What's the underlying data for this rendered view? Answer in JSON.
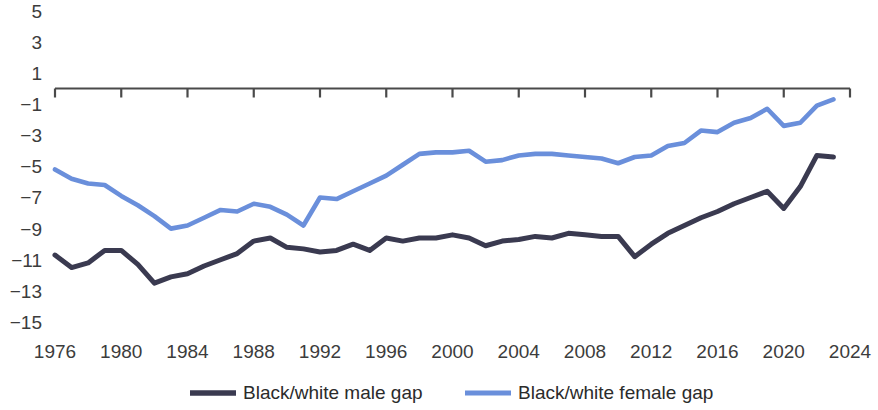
{
  "chart_data": {
    "type": "line",
    "title": "",
    "subtitle": "",
    "xlabel": "",
    "ylabel": "",
    "grid": false,
    "legend_position": "bottom",
    "xlim": [
      1976,
      2024
    ],
    "ylim": [
      -15,
      5
    ],
    "x_ticks": [
      "1976",
      "1980",
      "1984",
      "1988",
      "1992",
      "1996",
      "2000",
      "2004",
      "2008",
      "2012",
      "2016",
      "2020",
      "2024"
    ],
    "y_ticks": [
      "5",
      "3",
      "1",
      "−1",
      "−3",
      "−5",
      "−7",
      "−9",
      "−11",
      "−13",
      "−15"
    ],
    "x": [
      1976,
      1977,
      1978,
      1979,
      1980,
      1981,
      1982,
      1983,
      1984,
      1985,
      1986,
      1987,
      1988,
      1989,
      1990,
      1991,
      1992,
      1993,
      1994,
      1995,
      1996,
      1997,
      1998,
      1999,
      2000,
      2001,
      2002,
      2003,
      2004,
      2005,
      2006,
      2007,
      2008,
      2009,
      2010,
      2011,
      2012,
      2013,
      2014,
      2015,
      2016,
      2017,
      2018,
      2019,
      2020,
      2021,
      2022,
      2023
    ],
    "series": [
      {
        "name": "Black/white male gap",
        "color": "#3a3a50",
        "values": [
          -10.7,
          -11.5,
          -11.2,
          -10.4,
          -10.4,
          -11.3,
          -12.5,
          -12.1,
          -11.9,
          -11.4,
          -11.0,
          -10.6,
          -9.8,
          -9.6,
          -10.2,
          -10.3,
          -10.5,
          -10.4,
          -10.0,
          -10.4,
          -9.6,
          -9.8,
          -9.6,
          -9.6,
          -9.4,
          -9.6,
          -10.1,
          -9.8,
          -9.7,
          -9.5,
          -9.6,
          -9.3,
          -9.4,
          -9.5,
          -9.5,
          -10.8,
          -10.0,
          -9.3,
          -8.8,
          -8.3,
          -7.9,
          -7.4,
          -7.0,
          -6.6,
          -7.7,
          -6.3,
          -4.3,
          -4.4
        ]
      },
      {
        "name": "Black/white female gap",
        "color": "#6a8fdb",
        "values": [
          -5.2,
          -5.8,
          -6.1,
          -6.2,
          -6.9,
          -7.5,
          -8.2,
          -9.0,
          -8.8,
          -8.3,
          -7.8,
          -7.9,
          -7.4,
          -7.6,
          -8.1,
          -8.8,
          -7.0,
          -7.1,
          -6.6,
          -6.1,
          -5.6,
          -4.9,
          -4.2,
          -4.1,
          -4.1,
          -4.0,
          -4.7,
          -4.6,
          -4.3,
          -4.2,
          -4.2,
          -4.3,
          -4.4,
          -4.5,
          -4.8,
          -4.4,
          -4.3,
          -3.7,
          -3.5,
          -2.7,
          -2.8,
          -2.2,
          -1.9,
          -1.3,
          -2.4,
          -2.2,
          -1.1,
          -0.7
        ]
      }
    ]
  },
  "legend": {
    "items": [
      {
        "label": "Black/white male gap",
        "color": "#3a3a50"
      },
      {
        "label": "Black/white female gap",
        "color": "#6a8fdb"
      }
    ]
  }
}
